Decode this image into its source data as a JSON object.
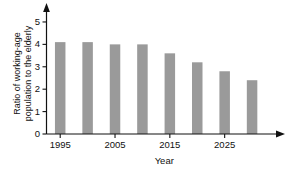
{
  "chart_data": {
    "type": "bar",
    "title": "",
    "subtitle": "",
    "xlabel": "Year",
    "ylabel": "Ratio of working-age population to the elderly",
    "ylabel_lines": [
      "Ratio of working-age",
      "population to the elderly"
    ],
    "categories": [
      "1995",
      "2000",
      "2005",
      "2010",
      "2015",
      "2020",
      "2025",
      "2030"
    ],
    "x": [
      1995,
      2000,
      2005,
      2010,
      2015,
      2020,
      2025,
      2030
    ],
    "values": [
      4.1,
      4.1,
      4.0,
      4.0,
      3.6,
      3.2,
      2.8,
      2.4
    ],
    "xlim": [
      1992.5,
      2034
    ],
    "ylim": [
      0,
      5.4
    ],
    "ytick_labels": [
      "0",
      "1",
      "2",
      "3",
      "4",
      "5"
    ],
    "ytick_values": [
      0,
      1,
      2,
      3,
      4,
      5
    ],
    "xtick_labels": [
      "1995",
      "2005",
      "2015",
      "2025"
    ],
    "xtick_values": [
      1995,
      2005,
      2015,
      2025
    ],
    "grid": false,
    "legend": false,
    "legend_position": "none",
    "bar_color": "#9a9a9a",
    "axis_color": "#111111",
    "background_color": "#ffffff",
    "axis_arrows": true
  }
}
